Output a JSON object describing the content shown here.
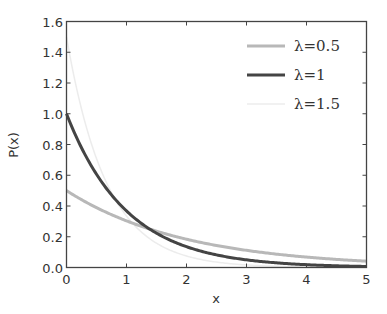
{
  "chart_data": {
    "type": "line",
    "title": "",
    "xlabel": "x",
    "ylabel": "P(x)",
    "xlim": [
      0,
      5
    ],
    "ylim": [
      0,
      1.6
    ],
    "xticks": [
      0,
      1,
      2,
      3,
      4,
      5
    ],
    "yticks": [
      0.0,
      0.2,
      0.4,
      0.6,
      0.8,
      1.0,
      1.2,
      1.4,
      1.6
    ],
    "xtick_labels": [
      "0",
      "1",
      "2",
      "3",
      "4",
      "5"
    ],
    "ytick_labels": [
      "0.0",
      "0.2",
      "0.4",
      "0.6",
      "0.8",
      "1.0",
      "1.2",
      "1.4",
      "1.6"
    ],
    "grid": false,
    "legend_position": "upper right",
    "function": "P(x) = lambda * exp(-lambda * x)",
    "series": [
      {
        "name": "λ=0.5",
        "lambda": 0.5,
        "color": "#b8b8b8",
        "width": 3,
        "x": [
          0,
          0.5,
          1,
          1.5,
          2,
          2.5,
          3,
          3.5,
          4,
          4.5,
          5
        ],
        "values": [
          0.5,
          0.389,
          0.303,
          0.236,
          0.184,
          0.143,
          0.112,
          0.087,
          0.068,
          0.053,
          0.041
        ]
      },
      {
        "name": "λ=1",
        "lambda": 1,
        "color": "#444444",
        "width": 3,
        "x": [
          0,
          0.5,
          1,
          1.5,
          2,
          2.5,
          3,
          3.5,
          4,
          4.5,
          5
        ],
        "values": [
          1.0,
          0.607,
          0.368,
          0.223,
          0.135,
          0.082,
          0.05,
          0.03,
          0.018,
          0.011,
          0.007
        ]
      },
      {
        "name": "λ=1.5",
        "lambda": 1.5,
        "color": "#ececec",
        "width": 1.5,
        "x": [
          0,
          0.5,
          1,
          1.5,
          2,
          2.5,
          3,
          3.5,
          4,
          4.5,
          5
        ],
        "values": [
          1.5,
          0.708,
          0.335,
          0.158,
          0.075,
          0.035,
          0.017,
          0.008,
          0.004,
          0.002,
          0.001
        ]
      }
    ]
  },
  "legend": {
    "items": [
      {
        "label": "λ=0.5",
        "color": "#b8b8b8"
      },
      {
        "label": "λ=1",
        "color": "#444444"
      },
      {
        "label": "λ=1.5",
        "color": "#ececec"
      }
    ]
  },
  "axes": {
    "xlabel": "x",
    "ylabel": "P(x)"
  }
}
